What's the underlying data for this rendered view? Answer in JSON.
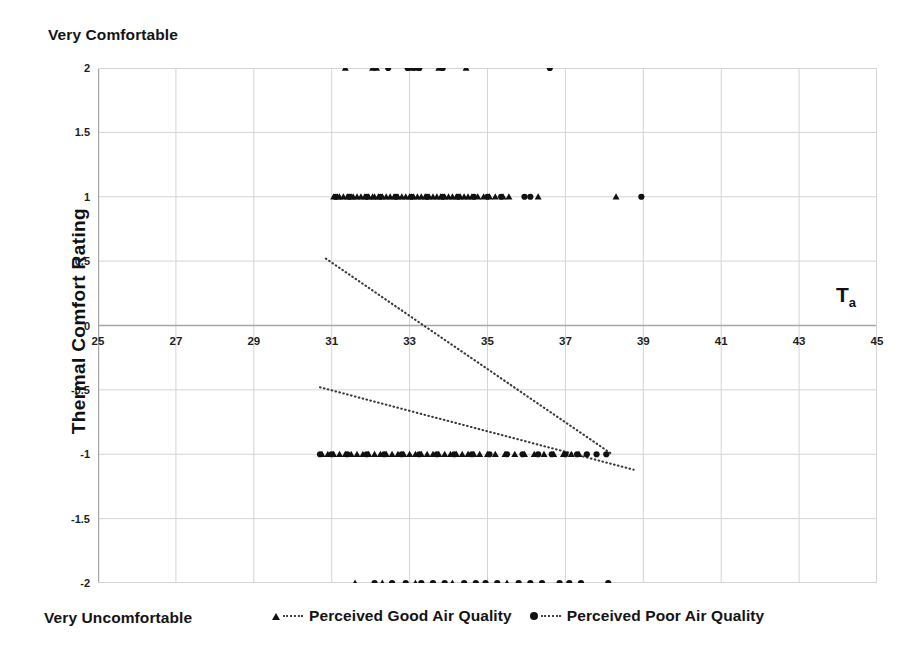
{
  "annotations": {
    "top_left": "Very Comfortable",
    "bottom_left": "Very Uncomfortable",
    "axis_variable": "T",
    "axis_variable_sub": "a"
  },
  "legend": {
    "position": "bottom-center",
    "entries": [
      {
        "marker": "triangle-marker-icon",
        "label": "Perceived Good Air Quality"
      },
      {
        "marker": "circle-marker-icon",
        "label": "Perceived Poor Air Quality"
      }
    ]
  },
  "colors": {
    "marker": "#111111",
    "gridline": "#d4d4d4",
    "axis": "#a6a6a6",
    "trendline": "#3a3a3a",
    "background": "#ffffff",
    "text": "#141414"
  },
  "chart_data": {
    "type": "scatter",
    "title": "",
    "subtitle": "",
    "xlabel": "Ta",
    "ylabel": "Thermal Comfort  Rating",
    "xlim": [
      25,
      45
    ],
    "ylim": [
      -2,
      2
    ],
    "grid": true,
    "xticks": [
      25,
      27,
      29,
      31,
      33,
      35,
      37,
      39,
      41,
      43,
      45
    ],
    "yticks": [
      2,
      1.5,
      1,
      0.5,
      0,
      -0.5,
      -1,
      -1.5,
      -2
    ],
    "ytick_labels": [
      "2",
      "1.5",
      "1",
      "0.5",
      "0",
      "-0.5",
      "-1",
      "-1.5",
      "-2"
    ],
    "xtick_labels": [
      "25",
      "27",
      "29",
      "31",
      "33",
      "35",
      "37",
      "39",
      "41",
      "43",
      "45"
    ],
    "y_axis_endpoint_labels": {
      "top": "Very Comfortable",
      "bottom": "Very Uncomfortable"
    },
    "series": [
      {
        "name": "Perceived Good Air Quality",
        "marker": "triangle",
        "color": "#111111",
        "points": [
          [
            31.35,
            2
          ],
          [
            32.05,
            2
          ],
          [
            32.15,
            2
          ],
          [
            33.05,
            2
          ],
          [
            33.15,
            2
          ],
          [
            33.75,
            2
          ],
          [
            34.45,
            2
          ],
          [
            31.05,
            1
          ],
          [
            31.15,
            1
          ],
          [
            31.2,
            1
          ],
          [
            31.3,
            1
          ],
          [
            31.4,
            1
          ],
          [
            31.5,
            1
          ],
          [
            31.55,
            1
          ],
          [
            31.65,
            1
          ],
          [
            31.75,
            1
          ],
          [
            31.85,
            1
          ],
          [
            31.95,
            1
          ],
          [
            32.05,
            1
          ],
          [
            32.1,
            1
          ],
          [
            32.2,
            1
          ],
          [
            32.3,
            1
          ],
          [
            32.4,
            1
          ],
          [
            32.5,
            1
          ],
          [
            32.6,
            1
          ],
          [
            32.7,
            1
          ],
          [
            32.8,
            1
          ],
          [
            32.9,
            1
          ],
          [
            33.0,
            1
          ],
          [
            33.1,
            1
          ],
          [
            33.2,
            1
          ],
          [
            33.3,
            1
          ],
          [
            33.4,
            1
          ],
          [
            33.5,
            1
          ],
          [
            33.6,
            1
          ],
          [
            33.7,
            1
          ],
          [
            33.8,
            1
          ],
          [
            33.9,
            1
          ],
          [
            34.0,
            1
          ],
          [
            34.1,
            1
          ],
          [
            34.2,
            1
          ],
          [
            34.3,
            1
          ],
          [
            34.4,
            1
          ],
          [
            34.5,
            1
          ],
          [
            34.6,
            1
          ],
          [
            34.75,
            1
          ],
          [
            34.9,
            1
          ],
          [
            35.05,
            1
          ],
          [
            35.2,
            1
          ],
          [
            35.4,
            1
          ],
          [
            35.55,
            1
          ],
          [
            36.3,
            1
          ],
          [
            38.3,
            1
          ],
          [
            30.75,
            -1
          ],
          [
            30.9,
            -1
          ],
          [
            31.05,
            -1
          ],
          [
            31.2,
            -1
          ],
          [
            31.35,
            -1
          ],
          [
            31.5,
            -1
          ],
          [
            31.65,
            -1
          ],
          [
            31.8,
            -1
          ],
          [
            31.95,
            -1
          ],
          [
            32.1,
            -1
          ],
          [
            32.25,
            -1
          ],
          [
            32.4,
            -1
          ],
          [
            32.55,
            -1
          ],
          [
            32.7,
            -1
          ],
          [
            32.85,
            -1
          ],
          [
            33.0,
            -1
          ],
          [
            33.15,
            -1
          ],
          [
            33.3,
            -1
          ],
          [
            33.45,
            -1
          ],
          [
            33.6,
            -1
          ],
          [
            33.75,
            -1
          ],
          [
            33.9,
            -1
          ],
          [
            34.05,
            -1
          ],
          [
            34.2,
            -1
          ],
          [
            34.35,
            -1
          ],
          [
            34.5,
            -1
          ],
          [
            34.65,
            -1
          ],
          [
            34.8,
            -1
          ],
          [
            35.0,
            -1
          ],
          [
            35.2,
            -1
          ],
          [
            35.45,
            -1
          ],
          [
            35.7,
            -1
          ],
          [
            35.95,
            -1
          ],
          [
            36.2,
            -1
          ],
          [
            36.45,
            -1
          ],
          [
            36.7,
            -1
          ],
          [
            36.95,
            -1
          ],
          [
            37.15,
            -1
          ],
          [
            37.35,
            -1
          ],
          [
            31.6,
            -2
          ],
          [
            32.3,
            -2
          ],
          [
            33.15,
            -2
          ],
          [
            34.1,
            -2
          ],
          [
            35.5,
            -2
          ]
        ]
      },
      {
        "name": "Perceived Poor Air Quality",
        "marker": "circle",
        "color": "#111111",
        "points": [
          [
            32.45,
            2
          ],
          [
            32.95,
            2
          ],
          [
            33.25,
            2
          ],
          [
            33.85,
            2
          ],
          [
            36.6,
            2
          ],
          [
            31.1,
            1
          ],
          [
            31.45,
            1
          ],
          [
            31.9,
            1
          ],
          [
            32.25,
            1
          ],
          [
            32.65,
            1
          ],
          [
            33.05,
            1
          ],
          [
            33.45,
            1
          ],
          [
            33.85,
            1
          ],
          [
            34.25,
            1
          ],
          [
            34.65,
            1
          ],
          [
            35.0,
            1
          ],
          [
            35.35,
            1
          ],
          [
            35.95,
            1
          ],
          [
            36.1,
            1
          ],
          [
            38.95,
            1
          ],
          [
            30.7,
            -1
          ],
          [
            31.0,
            -1
          ],
          [
            31.4,
            -1
          ],
          [
            31.9,
            -1
          ],
          [
            32.35,
            -1
          ],
          [
            32.8,
            -1
          ],
          [
            33.25,
            -1
          ],
          [
            33.7,
            -1
          ],
          [
            34.15,
            -1
          ],
          [
            34.6,
            -1
          ],
          [
            35.05,
            -1
          ],
          [
            35.5,
            -1
          ],
          [
            35.9,
            -1
          ],
          [
            36.3,
            -1
          ],
          [
            36.65,
            -1
          ],
          [
            37.0,
            -1
          ],
          [
            37.3,
            -1
          ],
          [
            37.55,
            -1
          ],
          [
            37.8,
            -1
          ],
          [
            38.05,
            -1
          ],
          [
            32.1,
            -2
          ],
          [
            32.55,
            -2
          ],
          [
            32.9,
            -2
          ],
          [
            33.3,
            -2
          ],
          [
            33.6,
            -2
          ],
          [
            33.9,
            -2
          ],
          [
            34.4,
            -2
          ],
          [
            34.7,
            -2
          ],
          [
            34.95,
            -2
          ],
          [
            35.25,
            -2
          ],
          [
            35.8,
            -2
          ],
          [
            36.1,
            -2
          ],
          [
            36.4,
            -2
          ],
          [
            36.85,
            -2
          ],
          [
            37.1,
            -2
          ],
          [
            37.4,
            -2
          ],
          [
            38.1,
            -2
          ]
        ]
      }
    ],
    "trendlines": [
      {
        "name": "Perceived Good Air Quality trend",
        "style": "dotted",
        "color": "#3a3a3a",
        "x": [
          30.85,
          38.2
        ],
        "y": [
          0.52,
          -1.0
        ]
      },
      {
        "name": "Perceived Poor Air Quality trend",
        "style": "dotted",
        "color": "#3a3a3a",
        "x": [
          30.7,
          38.75
        ],
        "y": [
          -0.48,
          -1.12
        ]
      }
    ]
  }
}
